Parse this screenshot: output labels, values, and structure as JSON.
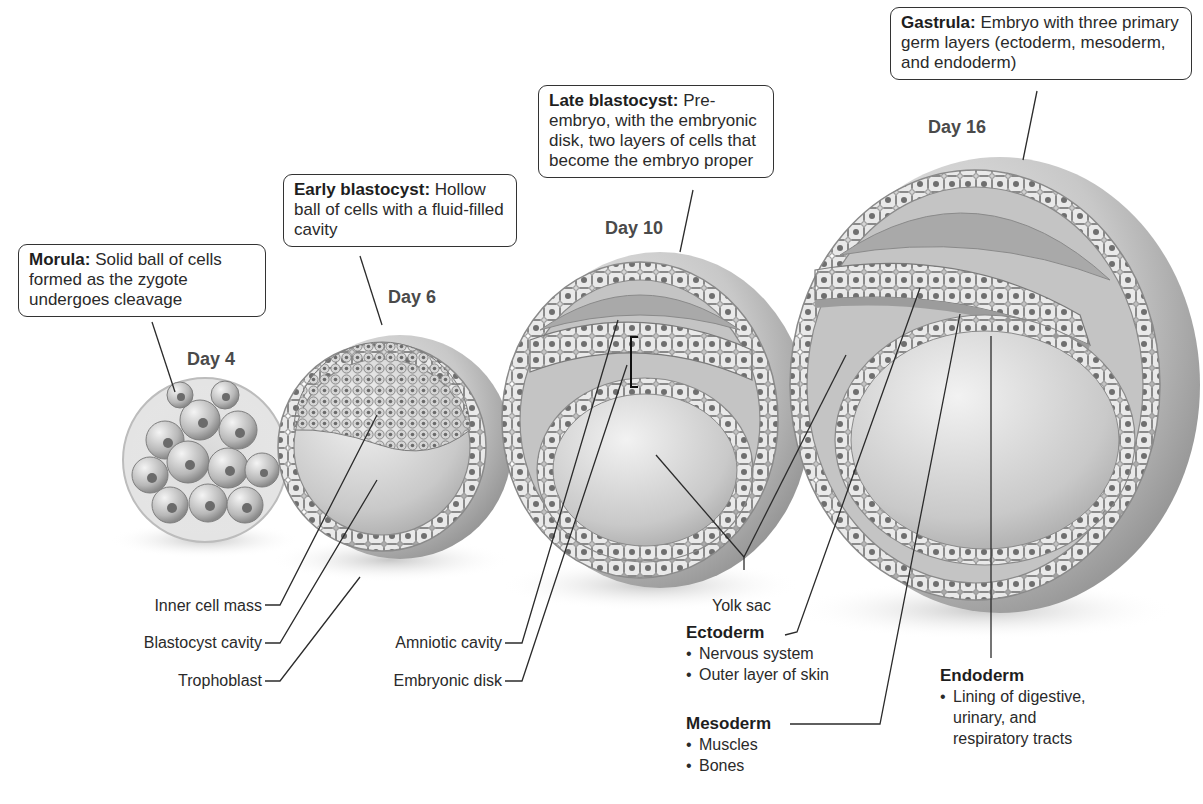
{
  "stages": [
    {
      "day": "Day 4",
      "callout": {
        "term": "Morula:",
        "text": "Solid ball of cells formed as the zygote undergoes cleavage"
      }
    },
    {
      "day": "Day 6",
      "callout": {
        "term": "Early blastocyst:",
        "text": "Hollow ball of cells with a fluid-filled cavity"
      }
    },
    {
      "day": "Day 10",
      "callout": {
        "term": "Late blastocyst:",
        "text": "Pre-embryo, with the embryonic disk, two layers of cells that become the embryo proper"
      }
    },
    {
      "day": "Day 16",
      "callout": {
        "term": "Gastrula:",
        "text": "Embryo with three primary germ layers (ectoderm, mesoderm, and endoderm)"
      }
    }
  ],
  "labels": {
    "inner_cell_mass": "Inner cell mass",
    "blastocyst_cavity": "Blastocyst cavity",
    "trophoblast": "Trophoblast",
    "amniotic_cavity": "Amniotic cavity",
    "embryonic_disk": "Embryonic disk",
    "yolk_sac": "Yolk sac"
  },
  "germ_layers": {
    "ectoderm": {
      "title": "Ectoderm",
      "items": [
        "Nervous system",
        "Outer layer of skin"
      ]
    },
    "mesoderm": {
      "title": "Mesoderm",
      "items": [
        "Muscles",
        "Bones"
      ]
    },
    "endoderm": {
      "title": "Endoderm",
      "items": [
        "Lining of digestive,",
        "urinary, and",
        "respiratory tracts"
      ]
    }
  },
  "colors": {
    "line": "#2b2b2b",
    "cell_fill": "#e6e6e6",
    "cell_nucleus": "#6e6e6e",
    "shell": "#bdbdbd",
    "cavity": "#d2d2d2"
  }
}
